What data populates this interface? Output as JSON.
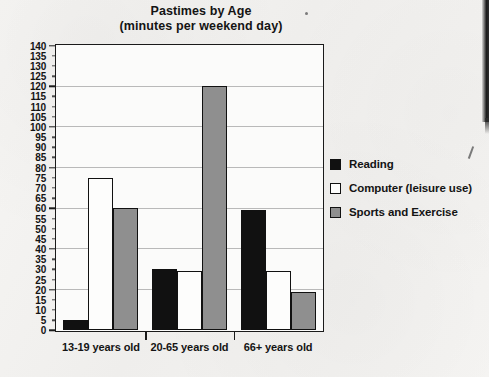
{
  "document": {
    "title_line_1": "Pastimes by Age",
    "title_line_2": "(minutes per weekend day)"
  },
  "chart_data": {
    "type": "bar",
    "title": "Pastimes by Age (minutes per weekend day)",
    "xlabel": "",
    "ylabel": "",
    "ylim": [
      0,
      140
    ],
    "ytick_step": 5,
    "grid": true,
    "legend_position": "right",
    "categories": [
      "13-19 years old",
      "20-65 years old",
      "66+ years old"
    ],
    "series": [
      {
        "name": "Reading",
        "color": "#111111",
        "values": [
          5,
          30,
          59
        ]
      },
      {
        "name": "Computer (leisure use)",
        "color": "#fdfdfc",
        "values": [
          75,
          29,
          29
        ]
      },
      {
        "name": "Sports and Exercise",
        "color": "#8f8f8f",
        "values": [
          60,
          120,
          19
        ]
      }
    ],
    "ytick_labels": [
      "140",
      "135",
      "130",
      "125",
      "120",
      "115",
      "110",
      "105",
      "100",
      "95",
      "90",
      "85",
      "80",
      "75",
      "70",
      "65",
      "60",
      "55",
      "50",
      "45",
      "40",
      "35",
      "30",
      "25",
      "20",
      "15",
      "10",
      "5",
      "0"
    ],
    "major_gridline_values": [
      120,
      100,
      80,
      60,
      40,
      20
    ]
  },
  "legend": {
    "items": [
      {
        "label": "Reading",
        "swatch": "series-reading"
      },
      {
        "label": "Computer (leisure use)",
        "swatch": "series-computer"
      },
      {
        "label": "Sports and Exercise",
        "swatch": "series-sports"
      }
    ]
  }
}
